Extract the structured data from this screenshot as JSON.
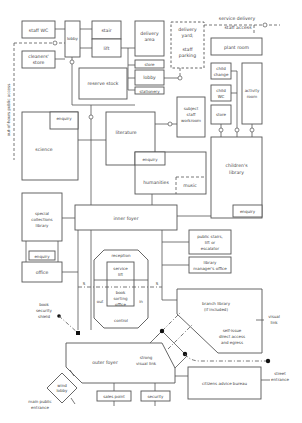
{
  "diagram": {
    "type": "library-space-relationship-plan",
    "rooms": {
      "staff_wc": "staff WC",
      "cleaners_store_1": "cleaners'",
      "cleaners_store_2": "store",
      "lobby_top": "lobby",
      "stair": "stair",
      "lift": "lift",
      "delivery_area_1": "delivery",
      "delivery_area_2": "area",
      "delivery_yard_1": "delivery",
      "delivery_yard_2": "yard;",
      "delivery_yard_3": "staff",
      "delivery_yard_4": "parking",
      "service_delivery": "service delivery",
      "staff_access": "staff access",
      "plant_room": "plant room",
      "reserve_stock": "reserve stock",
      "store": "store",
      "lobby": "lobby",
      "stationery": "stationery",
      "child_change_1": "child",
      "child_change_2": "change",
      "child_wc_1": "child",
      "child_wc_2": "WC",
      "activity_room_1": "activity",
      "activity_room_2": "room",
      "store_children": "store",
      "out_of_hours": "out-of-hours public access",
      "subject_staff_1": "subject",
      "subject_staff_2": "staff",
      "subject_staff_3": "workroom",
      "science": "science",
      "science_enquiry": "enquiry",
      "literature": "literature",
      "literature_enquiry": "enquiry",
      "humanities": "humanities",
      "music": "music",
      "childrens_library_1": "children's",
      "childrens_library_2": "library",
      "childrens_enquiry": "enquiry",
      "special_collections_1": "special",
      "special_collections_2": "collections",
      "special_collections_3": "library",
      "special_enquiry": "enquiry",
      "office": "office",
      "inner_foyer": "inner foyer",
      "public_stairs_1": "public stairs,",
      "public_stairs_2": "lift or",
      "public_stairs_3": "escalator",
      "library_manager_1": "library",
      "library_manager_2": "manager's office",
      "reception": "reception",
      "service_lift_1": "service",
      "service_lift_2": "lift",
      "book_sorting_1": "book",
      "book_sorting_2": "sorting",
      "book_sorting_3": "office",
      "out": "out",
      "in": "in",
      "control": "control",
      "s_left": "S",
      "s_right": "S",
      "book_security_1": "book",
      "book_security_2": "security",
      "book_security_3": "shield",
      "branch_library_1": "branch library",
      "branch_library_2": "(if included)",
      "visual_link_1": "visual",
      "visual_link_2": "link",
      "self_issue_1": "self-issue",
      "self_issue_2": "direct access",
      "self_issue_3": "and egress",
      "outer_foyer": "outer foyer",
      "strong_visual_1": "strong",
      "strong_visual_2": "visual link",
      "citizens_advice": "citizens advice bureau",
      "street_entrance_1": "street",
      "street_entrance_2": "entrance",
      "wind_lobby_1": "wind",
      "wind_lobby_2": "lobby",
      "main_entrance_1": "main public",
      "main_entrance_2": "entrance",
      "sales_point": "sales point",
      "security": "security"
    }
  }
}
